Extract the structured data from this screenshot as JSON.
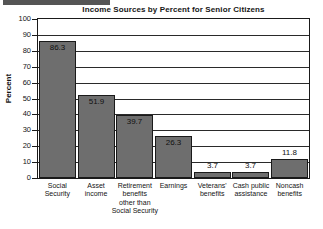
{
  "chart_data": {
    "type": "bar",
    "title": "Income Sources by Percent for Senior Citizens",
    "xlabel": "",
    "ylabel": "Percent",
    "ylim": [
      0,
      100
    ],
    "ytick_step": 10,
    "yticks": [
      "100",
      "90",
      "80",
      "70",
      "60",
      "50",
      "40",
      "30",
      "20",
      "10",
      "0"
    ],
    "grid": true,
    "legend": "none",
    "categories": [
      "Social Security",
      "Asset income",
      "Retirement benefits other than Social Security",
      "Earnings",
      "Veterans' benefits",
      "Cash public assistance",
      "Noncash benefits"
    ],
    "category_lines": [
      [
        "Social",
        "Security"
      ],
      [
        "Asset",
        "income"
      ],
      [
        "Retirement",
        "benefits",
        "other than",
        "Social Security"
      ],
      [
        "Earnings"
      ],
      [
        "Veterans'",
        "benefits"
      ],
      [
        "Cash public",
        "assistance"
      ],
      [
        "Noncash",
        "benefits"
      ]
    ],
    "values": [
      86.3,
      51.9,
      39.7,
      26.3,
      3.7,
      3.7,
      11.8
    ],
    "value_labels": [
      "86.3",
      "51.9",
      "39.7",
      "26.3",
      "3.7",
      "3.7",
      "11.8"
    ],
    "bar_color": "#6e6e6e",
    "bar_border_color": "#1a1a1a",
    "axis_color": "#1a1a1a"
  }
}
